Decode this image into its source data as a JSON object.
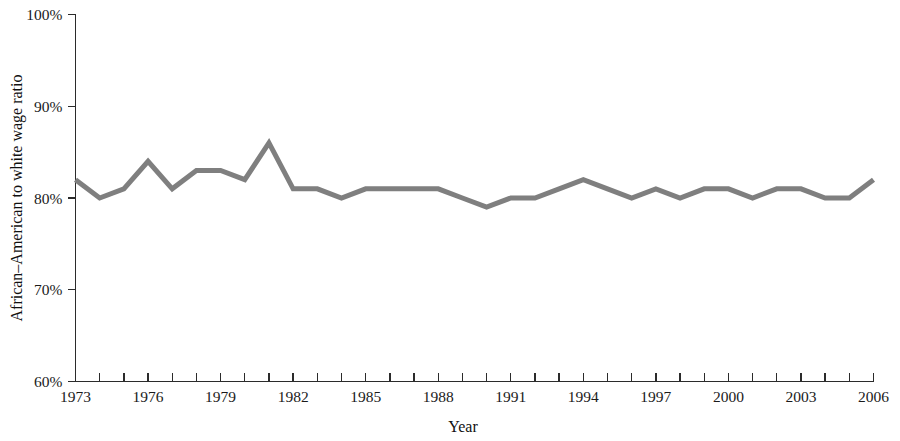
{
  "chart_data": {
    "type": "line",
    "title": "",
    "subtitle": "",
    "xlabel": "Year",
    "ylabel": "African–American to white wage ratio",
    "xlim": [
      1973,
      2006
    ],
    "ylim": [
      60,
      100
    ],
    "grid": false,
    "legend": null,
    "y_tick_labels": [
      "100%",
      "90%",
      "80%",
      "70%",
      "60%"
    ],
    "y_tick_values": [
      100,
      90,
      80,
      70,
      60
    ],
    "x_tick_labels": [
      "1973",
      "1976",
      "1979",
      "1982",
      "1985",
      "1988",
      "1991",
      "1994",
      "1997",
      "2000",
      "2003",
      "2006"
    ],
    "x_tick_values": [
      1973,
      1976,
      1979,
      1982,
      1985,
      1988,
      1991,
      1994,
      1997,
      2000,
      2003,
      2006
    ],
    "x_minor_ticks_every": 1,
    "line_color": "#7f7f7f",
    "line_width": 5,
    "axis_color": "#2b2b2b",
    "background_color": "#ffffff",
    "x": [
      1973,
      1974,
      1975,
      1976,
      1977,
      1978,
      1979,
      1980,
      1981,
      1982,
      1983,
      1984,
      1985,
      1986,
      1987,
      1988,
      1989,
      1990,
      1991,
      1992,
      1993,
      1994,
      1995,
      1996,
      1997,
      1998,
      1999,
      2000,
      2001,
      2002,
      2003,
      2004,
      2005,
      2006
    ],
    "values": [
      82,
      80,
      81,
      84,
      81,
      83,
      83,
      82,
      86,
      81,
      81,
      80,
      81,
      81,
      81,
      81,
      80,
      79,
      80,
      80,
      81,
      82,
      81,
      80,
      81,
      80,
      81,
      81,
      80,
      81,
      81,
      80,
      80,
      82
    ],
    "series": [
      {
        "name": "African-American to white wage ratio",
        "color": "#7f7f7f",
        "values": [
          82,
          80,
          81,
          84,
          81,
          83,
          83,
          82,
          86,
          81,
          81,
          80,
          81,
          81,
          81,
          81,
          80,
          79,
          80,
          80,
          81,
          82,
          81,
          80,
          81,
          80,
          81,
          81,
          80,
          81,
          81,
          80,
          80,
          82
        ]
      }
    ],
    "units": "percent",
    "annotations": []
  }
}
